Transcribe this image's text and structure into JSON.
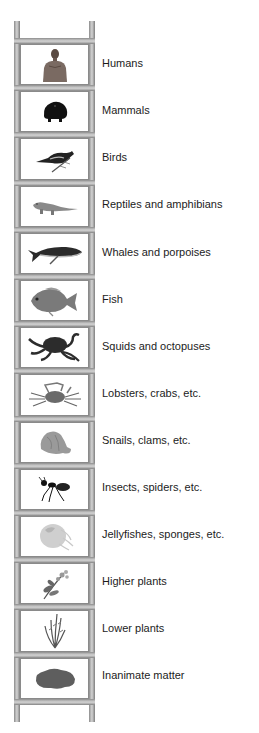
{
  "diagram": {
    "type": "ladder-of-nature",
    "colors": {
      "rail": "#b4b4b4",
      "cell_border": "#8a8a8a",
      "text": "#1c1c1c",
      "background": "#ffffff"
    },
    "rungs": [
      {
        "label": "Humans",
        "icon": "human-icon"
      },
      {
        "label": "Mammals",
        "icon": "mammal-icon"
      },
      {
        "label": "Birds",
        "icon": "bird-icon"
      },
      {
        "label": "Reptiles and amphibians",
        "icon": "reptile-icon"
      },
      {
        "label": "Whales and porpoises",
        "icon": "whale-icon"
      },
      {
        "label": "Fish",
        "icon": "fish-icon"
      },
      {
        "label": "Squids and octopuses",
        "icon": "octopus-icon"
      },
      {
        "label": "Lobsters, crabs, etc.",
        "icon": "crab-icon"
      },
      {
        "label": "Snails, clams, etc.",
        "icon": "shell-icon"
      },
      {
        "label": "Insects, spiders, etc.",
        "icon": "ant-icon"
      },
      {
        "label": "Jellyfishes, sponges, etc.",
        "icon": "jellyfish-icon"
      },
      {
        "label": "Higher plants",
        "icon": "flowering-plant-icon"
      },
      {
        "label": "Lower plants",
        "icon": "grass-plant-icon"
      },
      {
        "label": "Inanimate matter",
        "icon": "rock-icon"
      }
    ]
  }
}
